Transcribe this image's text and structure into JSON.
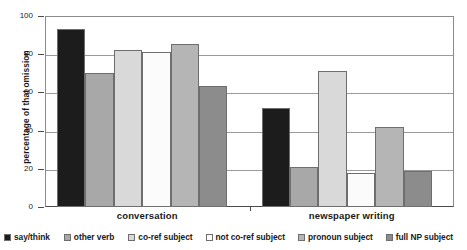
{
  "chart_data": {
    "type": "bar",
    "title": "",
    "xlabel": "",
    "ylabel": "percentage of that omission",
    "categories": [
      "conversation",
      "newspaper writing"
    ],
    "ylim": [
      0,
      100
    ],
    "yticks": [
      0,
      20,
      40,
      60,
      80,
      100
    ],
    "grid": true,
    "legend_position": "bottom",
    "series": [
      {
        "name": "say/think",
        "values": [
          93,
          52
        ],
        "color": "#1c1c1c"
      },
      {
        "name": "other verb",
        "values": [
          70,
          21
        ],
        "color": "#a8a8a8"
      },
      {
        "name": "co-ref subject",
        "values": [
          82,
          71
        ],
        "color": "#d9d9d9"
      },
      {
        "name": "not co-ref subject",
        "values": [
          81,
          18
        ],
        "color": "#fbfbfb"
      },
      {
        "name": "pronoun subject",
        "values": [
          85.5,
          42
        ],
        "color": "#b5b5b5"
      },
      {
        "name": "full NP subject",
        "values": [
          63.5,
          19
        ],
        "color": "#8c8c8c"
      }
    ]
  },
  "axis": {
    "y_title": "percentage of that omission",
    "y_tick_labels": [
      "100",
      "80",
      "60",
      "40",
      "20",
      "0"
    ],
    "x_tick_labels": [
      "conversation",
      "newspaper writing"
    ]
  },
  "legend": {
    "items": [
      {
        "label": "say/think",
        "color": "#1c1c1c"
      },
      {
        "label": "other verb",
        "color": "#a8a8a8"
      },
      {
        "label": "co-ref subject",
        "color": "#d9d9d9"
      },
      {
        "label": "not co-ref subject",
        "color": "#fbfbfb"
      },
      {
        "label": "pronoun subject",
        "color": "#b5b5b5"
      },
      {
        "label": "full NP subject",
        "color": "#8c8c8c"
      }
    ]
  }
}
